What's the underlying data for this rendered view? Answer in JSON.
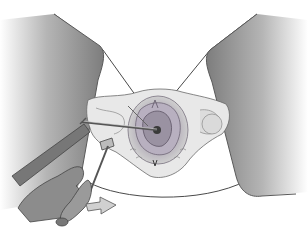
{
  "figure": {
    "colors": {
      "thigh_dark": "#8a8a8a",
      "thigh_light": "#ffffff",
      "outline": "#4a4a4a",
      "tissue_light": "#e6e6e6",
      "tissue_mid": "#c8c8c8",
      "ring_outer": "#9e96a6",
      "ring_inner": "#7a7280",
      "glove": "#8c8c8c",
      "drape": "#7a7a7a",
      "arrow_fill": "#d0d0d0"
    }
  }
}
